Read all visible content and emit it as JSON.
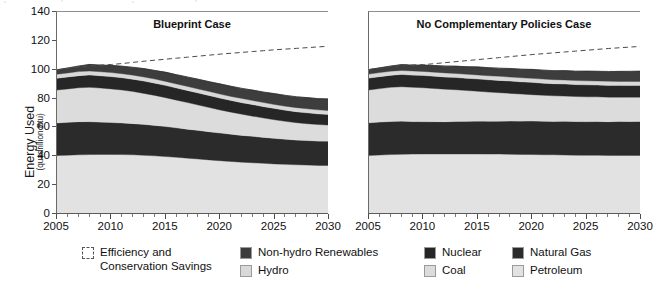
{
  "chart_data": {
    "type": "area",
    "title": "",
    "xlabel": "",
    "ylabel": "Energy Used",
    "ylabel_units": "(quadrillion Btu)",
    "ylim": [
      0,
      140
    ],
    "xlim": [
      2005,
      2030
    ],
    "yticks": [
      0,
      20,
      40,
      60,
      80,
      100,
      120,
      140
    ],
    "xticks": [
      2005,
      2010,
      2015,
      2020,
      2025,
      2030
    ],
    "xtick_minor_step": 1,
    "grid": false,
    "legend_position": "bottom",
    "stack_order_bottom_to_top": [
      "Petroleum",
      "Natural Gas",
      "Coal",
      "Nuclear",
      "Hydro",
      "Non-hydro Renewables"
    ],
    "series_colors": {
      "Petroleum": "#e2e2e2",
      "Natural Gas": "#2b2b2b",
      "Coal": "#dcdcdc",
      "Nuclear": "#262626",
      "Hydro": "#d9d9d9",
      "Non-hydro Renewables": "#3d3d3d",
      "Efficiency and Conservation Savings": "#ffffff"
    },
    "reference_line": {
      "label": "Efficiency and Conservation Savings (upper bound, reference demand)",
      "style": "dashed",
      "color": "#4a4a4a"
    },
    "panels": [
      {
        "title": "Blueprint Case",
        "x": [
          2005,
          2006,
          2007,
          2008,
          2009,
          2010,
          2011,
          2012,
          2013,
          2014,
          2015,
          2016,
          2017,
          2018,
          2019,
          2020,
          2021,
          2022,
          2023,
          2024,
          2025,
          2026,
          2027,
          2028,
          2029,
          2030
        ],
        "series": [
          {
            "name": "Petroleum",
            "values": [
              40.5,
              40.8,
              41.0,
              41.2,
              41.3,
              41.3,
              41.2,
              41.0,
              40.7,
              40.3,
              39.8,
              39.3,
              38.7,
              38.1,
              37.5,
              36.9,
              36.4,
              35.9,
              35.5,
              35.1,
              34.7,
              34.4,
              34.1,
              33.9,
              33.7,
              33.6
            ]
          },
          {
            "name": "Natural Gas",
            "values": [
              22.6,
              22.8,
              23.0,
              22.8,
              22.4,
              22.1,
              21.9,
              21.7,
              21.4,
              21.1,
              20.8,
              20.4,
              20.1,
              19.8,
              19.5,
              19.2,
              18.9,
              18.6,
              18.3,
              18.0,
              17.7,
              17.4,
              17.2,
              17.0,
              16.9,
              16.8
            ]
          },
          {
            "name": "Coal",
            "values": [
              22.8,
              23.1,
              23.5,
              23.8,
              23.6,
              23.3,
              22.8,
              22.2,
              21.5,
              20.8,
              20.0,
              19.2,
              18.4,
              17.6,
              16.8,
              16.0,
              15.3,
              14.6,
              14.0,
              13.4,
              12.9,
              12.4,
              12.0,
              11.7,
              11.4,
              11.2
            ]
          },
          {
            "name": "Nuclear",
            "values": [
              8.2,
              8.3,
              8.4,
              8.5,
              8.5,
              8.5,
              8.5,
              8.5,
              8.5,
              8.5,
              8.5,
              8.4,
              8.4,
              8.3,
              8.3,
              8.2,
              8.1,
              8.1,
              8.0,
              7.9,
              7.8,
              7.7,
              7.6,
              7.5,
              7.4,
              7.3
            ]
          },
          {
            "name": "Hydro",
            "values": [
              2.8,
              2.8,
              2.8,
              2.8,
              2.8,
              2.8,
              2.8,
              2.8,
              2.8,
              2.8,
              2.8,
              2.8,
              2.8,
              2.8,
              2.8,
              2.8,
              2.8,
              2.8,
              2.8,
              2.8,
              2.8,
              2.8,
              2.8,
              2.8,
              2.8,
              2.8
            ]
          },
          {
            "name": "Non-hydro Renewables",
            "values": [
              3.1,
              3.4,
              3.9,
              4.5,
              4.6,
              4.9,
              5.2,
              5.5,
              5.8,
              6.0,
              6.2,
              6.4,
              6.6,
              6.7,
              6.8,
              6.9,
              7.0,
              7.1,
              7.2,
              7.3,
              7.4,
              7.5,
              7.6,
              7.7,
              7.8,
              7.9
            ]
          }
        ],
        "reference_line_values": [
          99.8,
          100.8,
          101.8,
          102.8,
          103.2,
          103.6,
          104.3,
          105.1,
          105.9,
          106.6,
          107.3,
          108.0,
          108.7,
          109.4,
          110.1,
          110.8,
          111.4,
          112.0,
          112.6,
          113.2,
          113.8,
          114.3,
          114.8,
          115.3,
          115.8,
          116.3
        ]
      },
      {
        "title": "No Complementary Policies Case",
        "x": [
          2005,
          2006,
          2007,
          2008,
          2009,
          2010,
          2011,
          2012,
          2013,
          2014,
          2015,
          2016,
          2017,
          2018,
          2019,
          2020,
          2021,
          2022,
          2023,
          2024,
          2025,
          2026,
          2027,
          2028,
          2029,
          2030
        ],
        "series": [
          {
            "name": "Petroleum",
            "values": [
              40.6,
              40.9,
              41.2,
              41.4,
              41.5,
              41.6,
              41.6,
              41.6,
              41.6,
              41.6,
              41.6,
              41.5,
              41.5,
              41.4,
              41.3,
              41.2,
              41.1,
              41.0,
              40.9,
              40.8,
              40.7,
              40.7,
              40.6,
              40.6,
              40.6,
              40.6
            ]
          },
          {
            "name": "Natural Gas",
            "values": [
              22.6,
              22.8,
              23.0,
              22.9,
              22.6,
              22.4,
              22.4,
              22.4,
              22.5,
              22.6,
              22.7,
              22.8,
              22.9,
              23.0,
              23.1,
              23.2,
              23.2,
              23.2,
              23.3,
              23.3,
              23.3,
              23.4,
              23.4,
              23.5,
              23.5,
              23.5
            ]
          },
          {
            "name": "Coal",
            "values": [
              22.8,
              23.2,
              23.6,
              23.9,
              23.7,
              23.5,
              23.0,
              22.5,
              22.0,
              21.4,
              20.8,
              20.2,
              19.7,
              19.2,
              18.7,
              18.3,
              18.0,
              17.7,
              17.5,
              17.3,
              17.2,
              17.1,
              17.0,
              16.9,
              16.9,
              16.9
            ]
          },
          {
            "name": "Nuclear",
            "values": [
              8.2,
              8.3,
              8.4,
              8.5,
              8.5,
              8.5,
              8.5,
              8.5,
              8.5,
              8.5,
              8.5,
              8.5,
              8.5,
              8.5,
              8.5,
              8.5,
              8.4,
              8.4,
              8.4,
              8.3,
              8.3,
              8.2,
              8.2,
              8.1,
              8.1,
              8.0
            ]
          },
          {
            "name": "Hydro",
            "values": [
              2.8,
              2.8,
              2.8,
              2.8,
              2.8,
              2.8,
              2.8,
              2.8,
              2.8,
              2.8,
              2.8,
              2.8,
              2.8,
              2.8,
              2.8,
              2.8,
              2.8,
              2.8,
              2.8,
              2.8,
              2.8,
              2.8,
              2.8,
              2.8,
              2.8,
              2.8
            ]
          },
          {
            "name": "Non-hydro Renewables",
            "values": [
              3.1,
              3.3,
              3.6,
              4.0,
              4.1,
              4.3,
              4.6,
              4.8,
              5.0,
              5.2,
              5.4,
              5.6,
              5.7,
              5.9,
              6.0,
              6.1,
              6.2,
              6.3,
              6.4,
              6.5,
              6.6,
              6.7,
              6.8,
              6.9,
              7.0,
              7.1
            ]
          }
        ],
        "reference_line_values": [
          100.1,
          101.1,
          102.2,
          103.2,
          103.3,
          103.5,
          104.2,
          104.9,
          105.6,
          106.3,
          107.0,
          107.7,
          108.4,
          109.1,
          109.8,
          110.5,
          111.1,
          111.7,
          112.3,
          112.9,
          113.5,
          114.1,
          114.7,
          115.2,
          115.7,
          116.2
        ]
      }
    ],
    "legend": [
      {
        "label": "Efficiency and\nConservation Savings",
        "swatch": "dashed",
        "color": "#ffffff"
      },
      {
        "label": "Non-hydro Renewables",
        "swatch": "solid",
        "color": "#3d3d3d"
      },
      {
        "label": "Nuclear",
        "swatch": "solid",
        "color": "#262626"
      },
      {
        "label": "Natural Gas",
        "swatch": "solid",
        "color": "#2b2b2b"
      },
      {
        "label": "Hydro",
        "swatch": "solid",
        "color": "#d9d9d9"
      },
      {
        "label": "Coal",
        "swatch": "solid",
        "color": "#dcdcdc"
      },
      {
        "label": "Petroleum",
        "swatch": "solid",
        "color": "#e2e2e2"
      }
    ]
  },
  "axis": {
    "y_title_main": "Energy Used",
    "y_title_sub": "(quadrillion Btu)",
    "y_ticks": [
      "140",
      "120",
      "100",
      "80",
      "60",
      "40",
      "20",
      "0"
    ],
    "x_ticks": [
      "2005",
      "2010",
      "2015",
      "2020",
      "2025",
      "2030"
    ]
  },
  "panels": {
    "left_title": "Blueprint Case",
    "right_title": "No Complementary Policies Case"
  },
  "legend": {
    "efficiency_line1": "Efficiency and",
    "efficiency_line2": "Conservation Savings",
    "non_hydro": "Non-hydro Renewables",
    "nuclear": "Nuclear",
    "natural_gas": "Natural Gas",
    "hydro": "Hydro",
    "coal": "Coal",
    "petroleum": "Petroleum"
  }
}
